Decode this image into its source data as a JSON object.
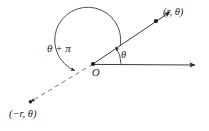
{
  "figure": {
    "name": "polar-coordinates-diagram",
    "background_color": "#ffffff",
    "line_color": "#3a3a3a",
    "text_color": "#1a1a1a",
    "width": 209,
    "height": 131
  },
  "labels": {
    "point_positive": "(r, θ)",
    "point_negative": "(−r, θ)",
    "angle_theta_plus_pi": "θ + π",
    "angle_theta": "θ",
    "origin": "O"
  },
  "geometry": {
    "origin": {
      "x": 93,
      "y": 64
    },
    "polar_axis_ray": {
      "from": [
        93,
        64
      ],
      "to": [
        197,
        65
      ],
      "style": "solid",
      "arrow": true
    },
    "terminal_ray": {
      "from": [
        93,
        64
      ],
      "to": [
        172,
        11
      ],
      "style": "solid",
      "arrow": true
    },
    "opposite_ray": {
      "from": [
        93,
        64
      ],
      "to": [
        27,
        104
      ],
      "style": "dashed",
      "arrow": true
    },
    "point_positive_marker": {
      "x": 156,
      "y": 21
    },
    "point_negative_marker": {
      "x": 30,
      "y": 102
    },
    "theta_arc": {
      "radius": 28,
      "start_deg": 0,
      "end_deg": 34,
      "arrow": true
    },
    "theta_plus_pi_arc": {
      "radius": 33,
      "start_deg": 34,
      "end_deg": 211,
      "arrow": true
    }
  }
}
